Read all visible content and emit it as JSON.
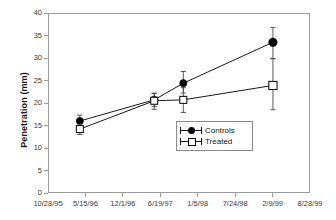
{
  "chart_data": {
    "type": "line",
    "title": "",
    "xlabel": "",
    "ylabel": "Penetration (mm)",
    "ylim": [
      0,
      40
    ],
    "ytick_values": [
      0,
      5,
      10,
      15,
      20,
      25,
      30,
      35,
      40
    ],
    "ytick_labels": [
      "0",
      "5",
      "10",
      "15",
      "20",
      "25",
      "30",
      "35",
      "40"
    ],
    "xtick_labels": [
      "10/28/95",
      "5/15/96",
      "12/1/96",
      "6/19/97",
      "1/5/98",
      "7/24/98",
      "2/9/99",
      "8/28/99"
    ],
    "xlim_labels": [
      "10/28/95",
      "8/28/99"
    ],
    "grid": false,
    "legend_position": "inside-lower-right",
    "error_bars": true,
    "series": [
      {
        "name": "Controls",
        "marker": "filled-circle",
        "color": "#000000",
        "x_labels": [
          "5/15/96",
          "6/19/97",
          "10/20/97",
          "2/9/99"
        ],
        "x_frac": [
          0.1215,
          0.4055,
          0.5165,
          0.8585
        ],
        "values": [
          16.0,
          20.7,
          24.4,
          33.5
        ],
        "err_low": [
          14.8,
          19.2,
          22.2,
          29.9
        ],
        "err_high": [
          17.3,
          22.2,
          27.0,
          36.8
        ]
      },
      {
        "name": "Treated",
        "marker": "open-square",
        "color": "#000000",
        "x_labels": [
          "5/15/96",
          "6/19/97",
          "10/20/97",
          "2/9/99"
        ],
        "x_frac": [
          0.1215,
          0.4055,
          0.5165,
          0.8585
        ],
        "values": [
          14.2,
          20.5,
          20.7,
          23.9
        ],
        "err_low": [
          13.0,
          18.6,
          17.9,
          18.5
        ],
        "err_high": [
          15.3,
          22.1,
          23.4,
          29.8
        ]
      }
    ]
  },
  "legend": {
    "items": [
      {
        "label": "Controls",
        "marker": "filled-circle"
      },
      {
        "label": "Treated",
        "marker": "open-square"
      }
    ]
  },
  "axis": {
    "y_title": "Penetration (mm)"
  }
}
